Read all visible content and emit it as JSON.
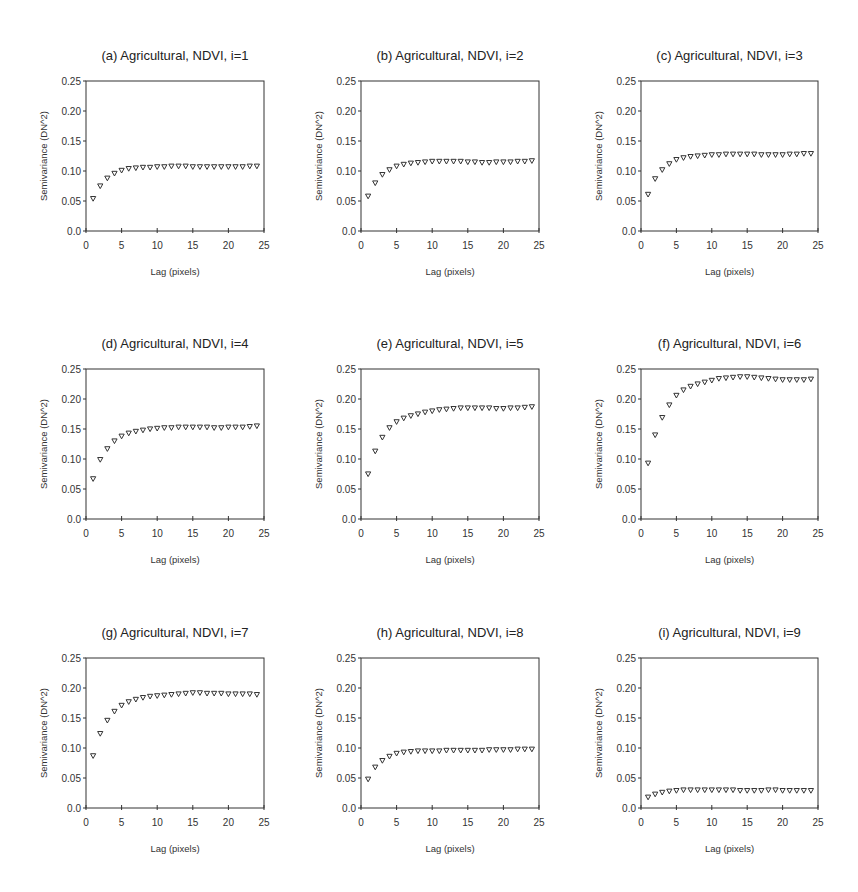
{
  "figure": {
    "panels_layout": {
      "rows": 3,
      "cols": 3
    }
  },
  "chart_data": [
    {
      "type": "scatter",
      "title": "(a) Agricultural, NDVI, i=1",
      "xlabel": "Lag (pixels)",
      "ylabel": "Semivariance (DN^2)",
      "xlim": [
        0,
        25
      ],
      "ylim": [
        0,
        0.25
      ],
      "xticks": [
        "0",
        "5",
        "10",
        "15",
        "20",
        "25"
      ],
      "yticks": [
        "0.0",
        "0.05",
        "0.10",
        "0.15",
        "0.20",
        "0.25"
      ],
      "marker": "open-down-triangle",
      "x": [
        1,
        2,
        3,
        4,
        5,
        6,
        7,
        8,
        9,
        10,
        11,
        12,
        13,
        14,
        15,
        16,
        17,
        18,
        19,
        20,
        21,
        22,
        23,
        24
      ],
      "values": [
        0.054,
        0.075,
        0.088,
        0.096,
        0.101,
        0.104,
        0.105,
        0.106,
        0.106,
        0.107,
        0.107,
        0.108,
        0.108,
        0.108,
        0.107,
        0.107,
        0.107,
        0.107,
        0.107,
        0.107,
        0.107,
        0.107,
        0.108,
        0.108
      ]
    },
    {
      "type": "scatter",
      "title": "(b) Agricultural, NDVI, i=2",
      "xlabel": "Lag (pixels)",
      "ylabel": "Semivariance (DN^2)",
      "xlim": [
        0,
        25
      ],
      "ylim": [
        0,
        0.25
      ],
      "xticks": [
        "0",
        "5",
        "10",
        "15",
        "20",
        "25"
      ],
      "yticks": [
        "0.0",
        "0.05",
        "0.10",
        "0.15",
        "0.20",
        "0.25"
      ],
      "marker": "open-down-triangle",
      "x": [
        1,
        2,
        3,
        4,
        5,
        6,
        7,
        8,
        9,
        10,
        11,
        12,
        13,
        14,
        15,
        16,
        17,
        18,
        19,
        20,
        21,
        22,
        23,
        24
      ],
      "values": [
        0.058,
        0.08,
        0.094,
        0.102,
        0.108,
        0.111,
        0.113,
        0.114,
        0.115,
        0.116,
        0.116,
        0.116,
        0.116,
        0.116,
        0.115,
        0.115,
        0.114,
        0.114,
        0.115,
        0.115,
        0.115,
        0.116,
        0.116,
        0.117
      ]
    },
    {
      "type": "scatter",
      "title": "(c) Agricultural, NDVI, i=3",
      "xlabel": "Lag (pixels)",
      "ylabel": "Semivariance (DN^2)",
      "xlim": [
        0,
        25
      ],
      "ylim": [
        0,
        0.25
      ],
      "xticks": [
        "0",
        "5",
        "10",
        "15",
        "20",
        "25"
      ],
      "yticks": [
        "0.0",
        "0.05",
        "0.10",
        "0.15",
        "0.20",
        "0.25"
      ],
      "marker": "open-down-triangle",
      "x": [
        1,
        2,
        3,
        4,
        5,
        6,
        7,
        8,
        9,
        10,
        11,
        12,
        13,
        14,
        15,
        16,
        17,
        18,
        19,
        20,
        21,
        22,
        23,
        24
      ],
      "values": [
        0.061,
        0.087,
        0.102,
        0.112,
        0.119,
        0.122,
        0.124,
        0.125,
        0.126,
        0.127,
        0.127,
        0.128,
        0.128,
        0.128,
        0.128,
        0.128,
        0.127,
        0.127,
        0.127,
        0.127,
        0.128,
        0.128,
        0.129,
        0.129
      ]
    },
    {
      "type": "scatter",
      "title": "(d) Agricultural, NDVI, i=4",
      "xlabel": "Lag (pixels)",
      "ylabel": "Semivariance (DN^2)",
      "xlim": [
        0,
        25
      ],
      "ylim": [
        0,
        0.25
      ],
      "xticks": [
        "0",
        "5",
        "10",
        "15",
        "20",
        "25"
      ],
      "yticks": [
        "0.0",
        "0.05",
        "0.10",
        "0.15",
        "0.20",
        "0.25"
      ],
      "marker": "open-down-triangle",
      "x": [
        1,
        2,
        3,
        4,
        5,
        6,
        7,
        8,
        9,
        10,
        11,
        12,
        13,
        14,
        15,
        16,
        17,
        18,
        19,
        20,
        21,
        22,
        23,
        24
      ],
      "values": [
        0.067,
        0.099,
        0.117,
        0.13,
        0.138,
        0.143,
        0.146,
        0.148,
        0.15,
        0.151,
        0.152,
        0.152,
        0.153,
        0.153,
        0.153,
        0.153,
        0.153,
        0.152,
        0.152,
        0.153,
        0.153,
        0.153,
        0.154,
        0.155
      ]
    },
    {
      "type": "scatter",
      "title": "(e) Agricultural, NDVI, i=5",
      "xlabel": "Lag (pixels)",
      "ylabel": "Semivariance (DN^2)",
      "xlim": [
        0,
        25
      ],
      "ylim": [
        0,
        0.25
      ],
      "xticks": [
        "0",
        "5",
        "10",
        "15",
        "20",
        "25"
      ],
      "yticks": [
        "0.0",
        "0.05",
        "0.10",
        "0.15",
        "0.20",
        "0.25"
      ],
      "marker": "open-down-triangle",
      "x": [
        1,
        2,
        3,
        4,
        5,
        6,
        7,
        8,
        9,
        10,
        11,
        12,
        13,
        14,
        15,
        16,
        17,
        18,
        19,
        20,
        21,
        22,
        23,
        24
      ],
      "values": [
        0.075,
        0.113,
        0.136,
        0.152,
        0.162,
        0.168,
        0.172,
        0.175,
        0.178,
        0.18,
        0.182,
        0.183,
        0.184,
        0.185,
        0.185,
        0.185,
        0.185,
        0.185,
        0.184,
        0.184,
        0.185,
        0.185,
        0.186,
        0.187
      ]
    },
    {
      "type": "scatter",
      "title": "(f) Agricultural, NDVI, i=6",
      "xlabel": "Lag (pixels)",
      "ylabel": "Semivariance (DN^2)",
      "xlim": [
        0,
        25
      ],
      "ylim": [
        0,
        0.25
      ],
      "xticks": [
        "0",
        "5",
        "10",
        "15",
        "20",
        "25"
      ],
      "yticks": [
        "0.0",
        "0.05",
        "0.10",
        "0.15",
        "0.20",
        "0.25"
      ],
      "marker": "open-down-triangle",
      "x": [
        1,
        2,
        3,
        4,
        5,
        6,
        7,
        8,
        9,
        10,
        11,
        12,
        13,
        14,
        15,
        16,
        17,
        18,
        19,
        20,
        21,
        22,
        23,
        24
      ],
      "values": [
        0.093,
        0.14,
        0.169,
        0.19,
        0.206,
        0.215,
        0.221,
        0.225,
        0.228,
        0.231,
        0.234,
        0.235,
        0.236,
        0.237,
        0.237,
        0.236,
        0.235,
        0.234,
        0.233,
        0.232,
        0.232,
        0.232,
        0.232,
        0.233
      ]
    },
    {
      "type": "scatter",
      "title": "(g) Agricultural, NDVI, i=7",
      "xlabel": "Lag (pixels)",
      "ylabel": "Semivariance (DN^2)",
      "xlim": [
        0,
        25
      ],
      "ylim": [
        0,
        0.25
      ],
      "xticks": [
        "0",
        "5",
        "10",
        "15",
        "20",
        "25"
      ],
      "yticks": [
        "0.0",
        "0.05",
        "0.10",
        "0.15",
        "0.20",
        "0.25"
      ],
      "marker": "open-down-triangle",
      "x": [
        1,
        2,
        3,
        4,
        5,
        6,
        7,
        8,
        9,
        10,
        11,
        12,
        13,
        14,
        15,
        16,
        17,
        18,
        19,
        20,
        21,
        22,
        23,
        24
      ],
      "values": [
        0.087,
        0.124,
        0.146,
        0.161,
        0.171,
        0.177,
        0.181,
        0.184,
        0.186,
        0.187,
        0.188,
        0.189,
        0.19,
        0.191,
        0.192,
        0.192,
        0.191,
        0.191,
        0.191,
        0.19,
        0.19,
        0.19,
        0.19,
        0.189
      ]
    },
    {
      "type": "scatter",
      "title": "(h) Agricultural, NDVI, i=8",
      "xlabel": "Lag (pixels)",
      "ylabel": "Semivariance (DN^2)",
      "xlim": [
        0,
        25
      ],
      "ylim": [
        0,
        0.25
      ],
      "xticks": [
        "0",
        "5",
        "10",
        "15",
        "20",
        "25"
      ],
      "yticks": [
        "0.0",
        "0.05",
        "0.10",
        "0.15",
        "0.20",
        "0.25"
      ],
      "marker": "open-down-triangle",
      "x": [
        1,
        2,
        3,
        4,
        5,
        6,
        7,
        8,
        9,
        10,
        11,
        12,
        13,
        14,
        15,
        16,
        17,
        18,
        19,
        20,
        21,
        22,
        23,
        24
      ],
      "values": [
        0.048,
        0.068,
        0.079,
        0.086,
        0.091,
        0.093,
        0.094,
        0.095,
        0.095,
        0.095,
        0.095,
        0.096,
        0.096,
        0.096,
        0.096,
        0.096,
        0.096,
        0.097,
        0.097,
        0.097,
        0.097,
        0.098,
        0.098,
        0.098
      ]
    },
    {
      "type": "scatter",
      "title": "(i) Agricultural, NDVI, i=9",
      "xlabel": "Lag (pixels)",
      "ylabel": "Semivariance (DN^2)",
      "xlim": [
        0,
        25
      ],
      "ylim": [
        0,
        0.25
      ],
      "xticks": [
        "0",
        "5",
        "10",
        "15",
        "20",
        "25"
      ],
      "yticks": [
        "0.0",
        "0.05",
        "0.10",
        "0.15",
        "0.20",
        "0.25"
      ],
      "marker": "open-down-triangle",
      "x": [
        1,
        2,
        3,
        4,
        5,
        6,
        7,
        8,
        9,
        10,
        11,
        12,
        13,
        14,
        15,
        16,
        17,
        18,
        19,
        20,
        21,
        22,
        23,
        24
      ],
      "values": [
        0.018,
        0.023,
        0.026,
        0.028,
        0.029,
        0.03,
        0.03,
        0.03,
        0.03,
        0.03,
        0.03,
        0.03,
        0.03,
        0.029,
        0.029,
        0.029,
        0.029,
        0.03,
        0.03,
        0.029,
        0.029,
        0.029,
        0.029,
        0.029
      ]
    }
  ]
}
